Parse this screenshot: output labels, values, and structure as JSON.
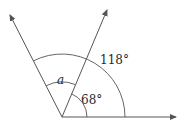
{
  "diagram": {
    "type": "angle-diagram",
    "vertex": [
      62,
      117
    ],
    "rays": [
      {
        "name": "right-ray",
        "end": [
          176,
          117
        ]
      },
      {
        "name": "middle-ray",
        "end": [
          107,
          9
        ]
      },
      {
        "name": "left-ray",
        "end": [
          9,
          14
        ]
      }
    ],
    "labels": {
      "angle_large": "118°",
      "angle_small": "68°",
      "angle_unknown": "a"
    },
    "colors": {
      "line": "#555555",
      "text": "#2a2a2a"
    }
  }
}
